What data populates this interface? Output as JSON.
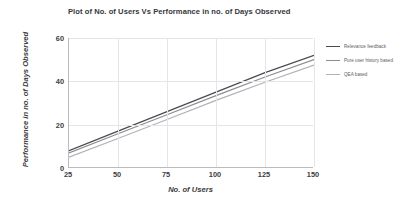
{
  "chart_data": {
    "type": "line",
    "title": "Plot of No. of Users Vs Performance in no. of Days Observed",
    "xlabel": "No. of Users",
    "ylabel": "Performance in no. of Days Observed",
    "xlim": [
      25,
      150
    ],
    "ylim": [
      0,
      60
    ],
    "xticks": [
      "25",
      "50",
      "75",
      "100",
      "125",
      "150"
    ],
    "yticks": [
      "60",
      "40",
      "20",
      "0"
    ],
    "xtick_values": [
      25,
      50,
      75,
      100,
      125,
      150
    ],
    "ytick_values": [
      60,
      40,
      20,
      0
    ],
    "grid": true,
    "legend_position": "right",
    "x": [
      25,
      50,
      75,
      100,
      125,
      150
    ],
    "series": [
      {
        "name": "Relevance feedback",
        "color": "#4a4a4f",
        "values": [
          8.0,
          17.0,
          26.0,
          35.0,
          44.0,
          52.0
        ]
      },
      {
        "name": "Pure user history based",
        "color": "#8b8d92",
        "values": [
          7.0,
          15.8,
          24.6,
          33.4,
          42.0,
          50.0
        ]
      },
      {
        "name": "QEA based",
        "color": "#b0b2b6",
        "values": [
          5.0,
          13.6,
          22.4,
          31.2,
          39.6,
          47.5
        ]
      }
    ]
  },
  "colors": {
    "axis": "#b9bcc2",
    "grid": "#e3e5e9",
    "text": "#3b3c40",
    "title": "#36373b",
    "background": "#ffffff"
  }
}
